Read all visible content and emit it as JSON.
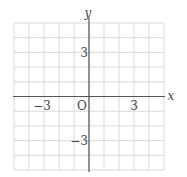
{
  "diagram": {
    "type": "coordinate-grid",
    "x_range": [
      -5,
      5
    ],
    "y_range": [
      -5,
      5
    ],
    "grid_step": 1,
    "axis_labels": {
      "x": "x",
      "y": "y"
    },
    "origin_label": "O",
    "tick_labels": {
      "x_neg": "−3",
      "x_pos": "3",
      "y_pos": "3",
      "y_neg": "−3"
    },
    "colors": {
      "grid": "#d8d8d8",
      "axis": "#555555",
      "text": "#444444",
      "background": "#ffffff"
    }
  }
}
